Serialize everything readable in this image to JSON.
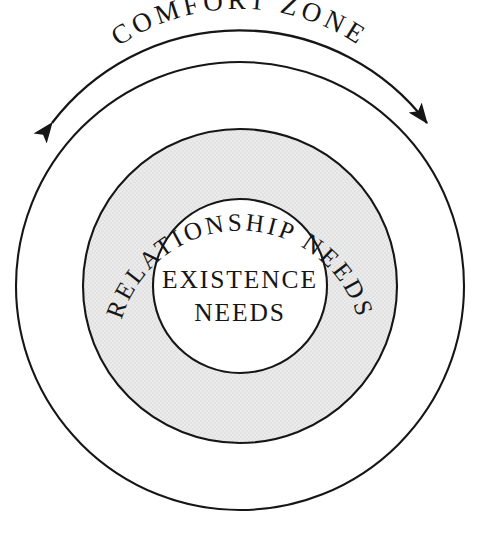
{
  "diagram": {
    "title_visible": false,
    "background_color": "#ffffff",
    "outline_color": "#161616",
    "text_color": "#161616",
    "ring_fill_color": "#e9e9e9",
    "inner_fill_color": "#ffffff",
    "outer_fill_color": "#ffffff",
    "layers": [
      {
        "id": "comfort-zone",
        "label": "COMFORT ZONE",
        "label_placement": "arc-above-outer-circle",
        "fill": "#ffffff",
        "radius": 224
      },
      {
        "id": "relationship-needs",
        "label": "RELATIONSHIP NEEDS",
        "label_placement": "arc-inside-ring",
        "fill": "#e9e9e9",
        "radius": 157
      },
      {
        "id": "existence-needs",
        "label_line_1": "EXISTENCE",
        "label_line_2": "NEEDS",
        "label_placement": "center-two-lines",
        "fill": "#ffffff",
        "radius": 87
      }
    ],
    "arrow": {
      "name": "double-headed-arc-arrow",
      "style": "double-headed",
      "spans_label": "COMFORT ZONE",
      "left_head_position": "lower-left",
      "right_head_position": "lower-right"
    },
    "center": {
      "x": 240,
      "y": 286
    }
  }
}
